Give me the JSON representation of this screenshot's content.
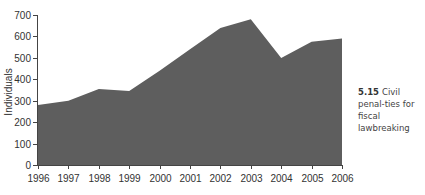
{
  "chart_data": {
    "type": "area",
    "title": "",
    "xlabel": "",
    "ylabel": "Individuals",
    "x": [
      "1996",
      "1997",
      "1998",
      "1999",
      "2000",
      "2001",
      "2002",
      "2003",
      "2004",
      "2005",
      "2006"
    ],
    "values": [
      280,
      300,
      355,
      345,
      440,
      540,
      640,
      680,
      500,
      575,
      590
    ],
    "ylim": [
      0,
      700
    ],
    "yticks": [
      0,
      100,
      200,
      300,
      400,
      500,
      600,
      700
    ],
    "grid": false,
    "legend": null,
    "fill_color": "#5e5e5e"
  },
  "caption": {
    "number": "5.15",
    "text": "Civil penal-ties for fiscal lawbreaking"
  }
}
